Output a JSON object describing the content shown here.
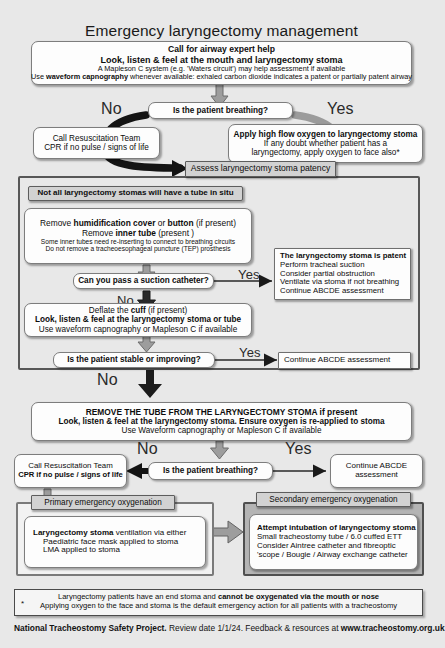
{
  "title": "Emergency laryngectomy management",
  "accent_colors": {
    "page_background": "#e8e8e8",
    "box_fill": "#fdfdfd",
    "grey_fill": "#d2d2d2",
    "panel_grey": "#b4b4b4",
    "border": "#6f6f6f",
    "arrow_grey": "#9a9a9a",
    "arrow_black": "#111111",
    "text": "#0d0d0d"
  },
  "call_help": {
    "line1": "Call for airway expert help",
    "line2": "Look, listen & feel at the mouth and laryngectomy stoma",
    "line3": "A Mapleson C system (e.g. 'Waters circuit') may help assessment if available",
    "line4_a": "Use ",
    "line4_b": "waveform capnography",
    "line4_c": " whenever available:  exhaled carbon dioxide indicates a patent or partially patent airway"
  },
  "decision1": {
    "question": "Is the patient breathing?",
    "no_label": "No",
    "yes_label": "Yes"
  },
  "resus_top": {
    "line1": "Call Resuscitation Team",
    "line2": "CPR if no pulse / signs of life"
  },
  "oxygen_top": {
    "line1": "Apply high flow oxygen to laryngectomy stoma",
    "line2": "If any doubt whether patient has a",
    "line3": "laryngectomy, apply oxygen to face also*"
  },
  "assess_header": "Assess laryngectomy stoma patency",
  "not_all_tubes": "Not all laryngectomy stomas will have a tube in situ",
  "remove_box": {
    "line1_a": "Remove ",
    "line1_b": "humidification cover",
    "line1_c": " or ",
    "line1_d": "button",
    "line1_e": " (if present)",
    "line2_a": "Remove ",
    "line2_b": "inner tube",
    "line2_c": " (present )",
    "line3": "Some inner tubes need re-inserting to connect to breathing circuits",
    "line4": "Do not remove a tracheoesophageal puncture (TEP) prosthesis"
  },
  "decision2": {
    "question": "Can you pass a suction catheter?",
    "yes_label": "Yes",
    "no_label": "No"
  },
  "patent_box": {
    "line1": "The laryngectomy stoma is patent",
    "line2": "Perform tracheal suction",
    "line3": "Consider partial obstruction",
    "line4": "Ventilate via stoma if not breathing",
    "line5": "Continue ABCDE assessment"
  },
  "deflate_box": {
    "line1_a": "Deflate the ",
    "line1_b": "cuff",
    "line1_c": " (if present)",
    "line2": "Look, listen & feel at the laryngectomy stoma or tube",
    "line3": "Use waveform capnography or Mapleson C if available"
  },
  "decision3": {
    "question": "Is the patient stable or improving?",
    "yes_label": "Yes",
    "no_label": "No"
  },
  "continue_abcde_1": "Continue ABCDE assessment",
  "remove_tube_box": {
    "line1": "REMOVE THE TUBE FROM THE LARYNGECTOMY STOMA if present",
    "line2": "Look, listen & feel at the laryngectomy stoma. Ensure oxygen is re-applied to stoma",
    "line3": "Use Waveform capnography or Mapleson C if available"
  },
  "decision4": {
    "question": "Is the patient breathing?",
    "no_label": "No",
    "yes_label": "Yes"
  },
  "resus_bottom": {
    "line1": "Call Resuscitation Team",
    "line2": "CPR if no pulse / signs of life"
  },
  "continue_abcde_2": {
    "line1": "Continue ABCDE",
    "line2": "assessment"
  },
  "primary_panel": {
    "header": "Primary emergency oxygenation",
    "line1_a": "Laryngectomy stoma",
    "line1_b": " ventilation via either",
    "line2": "Paediatric face mask applied to stoma",
    "line3": "LMA applied to stoma"
  },
  "secondary_panel": {
    "header": "Secondary emergency oxygenation",
    "line1": "Attempt intubation of laryngectomy stoma",
    "line2": "Small tracheostomy tube / 6.0 cuffed ETT",
    "line3": "Consider Aintree catheter and fibreoptic",
    "line4": "'scope / Bougie / Airway exchange catheter"
  },
  "footnote": {
    "star": "*",
    "line1_a": "Laryngectomy patients have an end stoma and ",
    "line1_b": "cannot be oxygenated via the mouth or nose",
    "line2": "Applying oxygen to the face and stoma is the default emergency action for all patients with a tracheostomy"
  },
  "footer": {
    "org": "National Tracheostomy Safety Project.",
    "review": " Review date 1/1/24. Feedback & resources at ",
    "url": "www.tracheostomy.org.uk"
  }
}
